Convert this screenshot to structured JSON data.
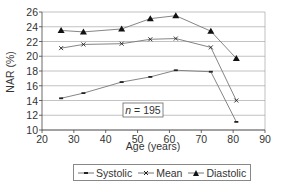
{
  "chart_data": {
    "type": "line",
    "title": "",
    "xlabel": "Age (years)",
    "ylabel": "NAR (%)",
    "xlim": [
      20,
      90
    ],
    "ylim": [
      10,
      26
    ],
    "xticks": [
      20,
      30,
      40,
      50,
      60,
      70,
      80,
      90
    ],
    "yticks": [
      10,
      12,
      14,
      16,
      18,
      20,
      22,
      24,
      26
    ],
    "grid": {
      "horizontal": true,
      "vertical": false
    },
    "legend_position": "bottom",
    "annotation": {
      "italic": "n",
      "text": " = 195"
    },
    "x": [
      26,
      33,
      45,
      54,
      62,
      73,
      81
    ],
    "series": [
      {
        "name": "Systolic",
        "marker": "dash",
        "values": [
          14.3,
          15.0,
          16.5,
          17.2,
          18.1,
          17.9,
          11.1
        ]
      },
      {
        "name": "Mean",
        "marker": "x",
        "values": [
          21.1,
          21.6,
          21.7,
          22.3,
          22.4,
          21.2,
          14.0
        ]
      },
      {
        "name": "Diastolic",
        "marker": "triangle",
        "values": [
          23.5,
          23.3,
          23.7,
          25.1,
          25.5,
          23.4,
          19.7
        ]
      }
    ]
  },
  "legend": {
    "items": [
      {
        "label": "Systolic"
      },
      {
        "label": "Mean"
      },
      {
        "label": "Diastolic"
      }
    ]
  },
  "colors": {
    "line": "#777777",
    "grid": "#999999",
    "marker": "#222222"
  }
}
